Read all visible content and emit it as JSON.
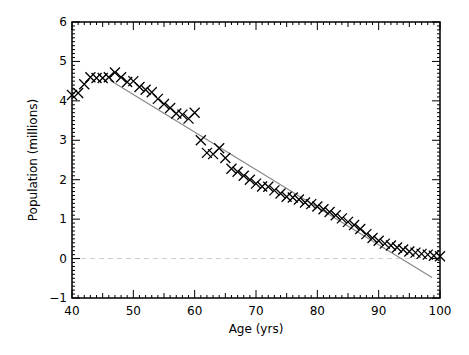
{
  "chart_data": {
    "type": "scatter",
    "title": "",
    "xlabel": "Age (yrs)",
    "ylabel": "Population (millions)",
    "xlim": [
      40,
      100
    ],
    "ylim": [
      -1,
      6
    ],
    "xticks": [
      40,
      50,
      60,
      70,
      80,
      90,
      100
    ],
    "yticks": [
      -1,
      0,
      1,
      2,
      3,
      4,
      5,
      6
    ],
    "grid": false,
    "legend": null,
    "series": [
      {
        "name": "Population by age",
        "marker": "x",
        "color": "#000000",
        "x": [
          40,
          41,
          42,
          43,
          44,
          45,
          46,
          47,
          48,
          49,
          50,
          51,
          52,
          53,
          54,
          55,
          56,
          57,
          58,
          59,
          60,
          61,
          62,
          63,
          64,
          65,
          66,
          67,
          68,
          69,
          70,
          71,
          72,
          73,
          74,
          75,
          76,
          77,
          78,
          79,
          80,
          81,
          82,
          83,
          84,
          85,
          86,
          87,
          88,
          89,
          90,
          91,
          92,
          93,
          94,
          95,
          96,
          97,
          98,
          99,
          100
        ],
        "values": [
          4.15,
          4.2,
          4.42,
          4.6,
          4.58,
          4.58,
          4.6,
          4.72,
          4.6,
          4.48,
          4.5,
          4.35,
          4.28,
          4.22,
          4.05,
          3.92,
          3.82,
          3.68,
          3.65,
          3.55,
          3.7,
          3.0,
          2.68,
          2.65,
          2.8,
          2.55,
          2.28,
          2.2,
          2.1,
          2.0,
          1.9,
          1.83,
          1.82,
          1.73,
          1.65,
          1.57,
          1.55,
          1.5,
          1.42,
          1.38,
          1.32,
          1.25,
          1.18,
          1.1,
          1.02,
          0.93,
          0.85,
          0.75,
          0.62,
          0.52,
          0.45,
          0.38,
          0.33,
          0.28,
          0.23,
          0.18,
          0.15,
          0.12,
          0.1,
          0.07,
          0.06
        ]
      },
      {
        "name": "Linear fit",
        "type": "line",
        "color": "#888888",
        "x": [
          46.2,
          98.7
        ],
        "values": [
          4.52,
          -0.48
        ]
      },
      {
        "name": "Zero reference",
        "type": "line",
        "style": "dashed",
        "color": "#cccccc",
        "x": [
          40,
          100
        ],
        "values": [
          0,
          0
        ]
      }
    ]
  }
}
